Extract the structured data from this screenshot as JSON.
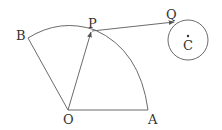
{
  "diagram": {
    "type": "geometry",
    "colors": {
      "stroke": "#6b6b6b",
      "text": "#333333",
      "background": "#ffffff"
    },
    "points": {
      "O": {
        "label": "O",
        "x": 68,
        "y": 110
      },
      "A": {
        "label": "A",
        "x": 148,
        "y": 110
      },
      "B": {
        "label": "B",
        "x": 28,
        "y": 38
      },
      "P": {
        "label": "P",
        "x": 92,
        "y": 31
      },
      "Q": {
        "label": "Q",
        "x": 174,
        "y": 22
      },
      "C": {
        "label": "C",
        "x": 188,
        "y": 40
      }
    },
    "elements": [
      {
        "kind": "segment",
        "from": "O",
        "to": "A"
      },
      {
        "kind": "segment",
        "from": "O",
        "to": "B"
      },
      {
        "kind": "arc",
        "center": "O",
        "from": "A",
        "to": "B"
      },
      {
        "kind": "vector",
        "from": "O",
        "to": "P"
      },
      {
        "kind": "vector",
        "from": "P",
        "to": "Q"
      },
      {
        "kind": "circle",
        "center": "C",
        "radius": 20
      },
      {
        "kind": "point-dot",
        "at": "C"
      }
    ]
  }
}
